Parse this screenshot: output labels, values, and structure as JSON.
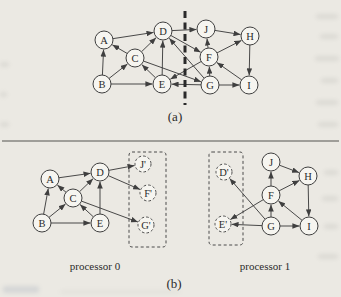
{
  "figure": {
    "caption_a": "(a)",
    "caption_b": "(b)"
  },
  "colors": {
    "background": "#ebe9e3",
    "line": "#3f3f3f",
    "cut_line": "#2a2a2a",
    "node_fill": "#f6f5f0",
    "node_stroke": "#3f3f3f",
    "ghost_stroke": "#4a4a4a",
    "text": "#2b2b2b",
    "separator": "#555550"
  },
  "separator": {
    "y": 141,
    "x1": 2,
    "x2": 339
  },
  "diagram_a": {
    "name": "global-graph",
    "node_radius": 9,
    "cut_line": {
      "x": 185,
      "y1": 11,
      "y2": 105
    },
    "nodes": [
      {
        "id": "A",
        "x": 104,
        "y": 40
      },
      {
        "id": "B",
        "x": 102,
        "y": 84
      },
      {
        "id": "C",
        "x": 135,
        "y": 58
      },
      {
        "id": "D",
        "x": 163,
        "y": 31
      },
      {
        "id": "E",
        "x": 162,
        "y": 84
      },
      {
        "id": "F",
        "x": 209,
        "y": 57
      },
      {
        "id": "G",
        "x": 210,
        "y": 85
      },
      {
        "id": "H",
        "x": 250,
        "y": 36
      },
      {
        "id": "I",
        "x": 249,
        "y": 85
      },
      {
        "id": "J",
        "x": 206,
        "y": 29
      }
    ],
    "edges": [
      [
        "A",
        "D"
      ],
      [
        "B",
        "A"
      ],
      [
        "B",
        "C"
      ],
      [
        "B",
        "E"
      ],
      [
        "C",
        "A"
      ],
      [
        "C",
        "D"
      ],
      [
        "C",
        "G"
      ],
      [
        "E",
        "C"
      ],
      [
        "E",
        "D"
      ],
      [
        "D",
        "J"
      ],
      [
        "D",
        "F"
      ],
      [
        "G",
        "D"
      ],
      [
        "G",
        "E"
      ],
      [
        "G",
        "F"
      ],
      [
        "G",
        "I"
      ],
      [
        "F",
        "E"
      ],
      [
        "F",
        "J"
      ],
      [
        "F",
        "H"
      ],
      [
        "J",
        "H"
      ],
      [
        "H",
        "I"
      ],
      [
        "I",
        "F"
      ]
    ]
  },
  "diagram_b": {
    "processors": [
      {
        "name": "processor-0-subgraph",
        "label": "processor 0",
        "label_center_x": 95,
        "label_top_y": 260,
        "node_radius": 9,
        "ghost_box": {
          "x": 129,
          "y": 152,
          "w": 37,
          "h": 95
        },
        "nodes": [
          {
            "id": "A",
            "x": 50,
            "y": 179
          },
          {
            "id": "B",
            "x": 42,
            "y": 223
          },
          {
            "id": "C",
            "x": 73,
            "y": 198
          },
          {
            "id": "D",
            "x": 100,
            "y": 172
          },
          {
            "id": "E",
            "x": 100,
            "y": 223
          },
          {
            "id": "J'",
            "x": 143,
            "y": 164,
            "ghost": true
          },
          {
            "id": "F'",
            "x": 148,
            "y": 193,
            "ghost": true
          },
          {
            "id": "G'",
            "x": 146,
            "y": 225,
            "ghost": true
          }
        ],
        "edges": [
          [
            "A",
            "D"
          ],
          [
            "B",
            "A"
          ],
          [
            "B",
            "C"
          ],
          [
            "B",
            "E"
          ],
          [
            "C",
            "A"
          ],
          [
            "C",
            "D"
          ],
          [
            "E",
            "C"
          ],
          [
            "E",
            "D"
          ],
          [
            "D",
            "J'"
          ],
          [
            "D",
            "F'"
          ],
          [
            "C",
            "G'"
          ]
        ]
      },
      {
        "name": "processor-1-subgraph",
        "label": "processor 1",
        "label_center_x": 265,
        "label_top_y": 260,
        "node_radius": 9,
        "ghost_box": {
          "x": 209,
          "y": 152,
          "w": 34,
          "h": 93
        },
        "nodes": [
          {
            "id": "J",
            "x": 271,
            "y": 162
          },
          {
            "id": "H",
            "x": 308,
            "y": 176
          },
          {
            "id": "F",
            "x": 271,
            "y": 195
          },
          {
            "id": "G",
            "x": 271,
            "y": 226
          },
          {
            "id": "I",
            "x": 309,
            "y": 226
          },
          {
            "id": "D'",
            "x": 224,
            "y": 172,
            "ghost": true
          },
          {
            "id": "E'",
            "x": 223,
            "y": 224,
            "ghost": true
          }
        ],
        "edges": [
          [
            "F",
            "J"
          ],
          [
            "F",
            "H"
          ],
          [
            "F",
            "E'"
          ],
          [
            "J",
            "H"
          ],
          [
            "G",
            "F"
          ],
          [
            "G",
            "D'"
          ],
          [
            "G",
            "E'"
          ],
          [
            "G",
            "I"
          ],
          [
            "H",
            "I"
          ],
          [
            "I",
            "F"
          ]
        ]
      }
    ]
  }
}
